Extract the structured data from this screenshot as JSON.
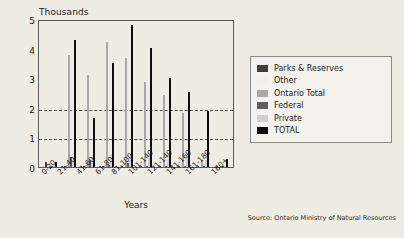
{
  "figure": {
    "units_label": "Thousands",
    "xlabel": "Years",
    "source": "Source: Ontario Ministry of Natural Resources"
  },
  "axis": {
    "yticks": [
      "5",
      "4",
      "3",
      "2",
      "1",
      "0"
    ],
    "gridlines": [
      2,
      1
    ]
  },
  "legend": {
    "items": [
      {
        "label": "Parks & Reserves",
        "color": "#3f3f3f"
      },
      {
        "label": "Other",
        "color": "#f2f0ea"
      },
      {
        "label": "Ontario Total",
        "color": "#a8a8a8"
      },
      {
        "label": "Federal",
        "color": "#5e5e5e"
      },
      {
        "label": "Private",
        "color": "#cfcfcf"
      },
      {
        "label": "TOTAL",
        "color": "#0d0d0d"
      }
    ]
  },
  "chart_data": {
    "type": "bar",
    "title": "",
    "subtitle": "",
    "xlabel": "Years",
    "ylabel": "Thousands",
    "ylim": [
      0,
      5
    ],
    "yticks": [
      0,
      1,
      2,
      3,
      4,
      5
    ],
    "grid": "horizontal dashed at 1 and 2",
    "legend_position": "right outside",
    "units": "Thousands",
    "categories": [
      "0-20",
      "21-40",
      "41-60",
      "61-80",
      "81-100",
      "101-140",
      "121-140",
      "141-160",
      "161-180",
      "180+"
    ],
    "series": [
      {
        "name": "Parks & Reserves",
        "color": "#3f3f3f",
        "values": [
          0.18,
          0.05,
          0.04,
          0.03,
          0.03,
          0.03,
          0.02,
          0.02,
          0.04,
          0.01
        ]
      },
      {
        "name": "Other",
        "color": "#f2f0ea",
        "values": [
          0.0,
          0.0,
          0.0,
          0.0,
          0.0,
          0.0,
          0.0,
          0.0,
          0.0,
          0.0
        ]
      },
      {
        "name": "Ontario Total",
        "color": "#a8a8a8",
        "values": [
          0.0,
          3.78,
          3.1,
          4.21,
          3.68,
          2.86,
          2.43,
          1.82,
          0.24,
          0.02
        ]
      },
      {
        "name": "Federal",
        "color": "#5e5e5e",
        "values": [
          0.0,
          0.34,
          0.23,
          0.06,
          0.12,
          0.05,
          0.04,
          0.05,
          0.03,
          0.01
        ]
      },
      {
        "name": "Private",
        "color": "#cfcfcf",
        "values": [
          0.0,
          0.36,
          0.33,
          0.45,
          0.4,
          0.3,
          0.28,
          0.33,
          0.23,
          0.02
        ]
      },
      {
        "name": "TOTAL",
        "color": "#0d0d0d",
        "values": [
          0.18,
          4.3,
          1.66,
          3.52,
          4.81,
          4.03,
          3.02,
          2.54,
          1.9,
          0.26
        ]
      }
    ],
    "secondary_bars_note": "Each category also shows a short light bar at 1.50 for 41-60 within the Ontario Total group",
    "extra_points": [
      {
        "category": "41-60",
        "series": "Ontario Total",
        "value": 1.5
      }
    ]
  }
}
